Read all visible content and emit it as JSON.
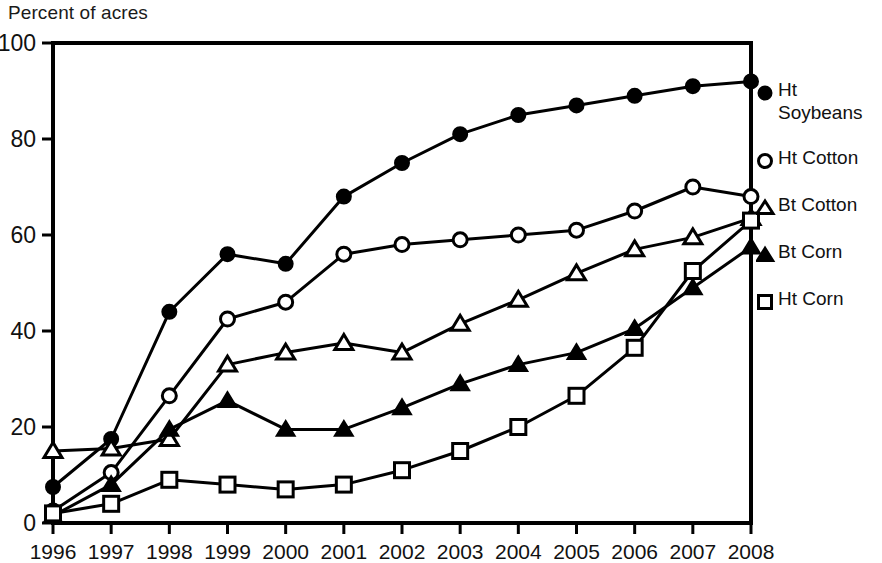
{
  "chart_data": {
    "type": "line",
    "title": "",
    "ylabel": "Percent of acres",
    "xlabel": "",
    "ylim": [
      0,
      100
    ],
    "yticks": [
      0,
      20,
      40,
      60,
      80,
      100
    ],
    "grid": false,
    "legend_position": "right",
    "categories": [
      "1996",
      "1997",
      "1998",
      "1999",
      "2000",
      "2001",
      "2002",
      "2003",
      "2004",
      "2005",
      "2006",
      "2007",
      "2008"
    ],
    "series": [
      {
        "name": "Ht Soybeans",
        "marker": "filled-circle",
        "values": [
          7.5,
          17.5,
          44,
          56,
          54,
          68,
          75,
          81,
          85,
          87,
          89,
          91,
          92
        ]
      },
      {
        "name": "Ht Cotton",
        "marker": "open-circle",
        "values": [
          2.5,
          10.5,
          26.5,
          42.5,
          46,
          56,
          58,
          59,
          60,
          61,
          65,
          70,
          68
        ]
      },
      {
        "name": "Bt Cotton",
        "marker": "open-triangle",
        "values": [
          15,
          15.5,
          17.5,
          33,
          35.5,
          37.5,
          35.5,
          41.5,
          46.5,
          52,
          57,
          59.5,
          63.5
        ]
      },
      {
        "name": "Bt Corn",
        "marker": "filled-triangle",
        "values": [
          1.5,
          8,
          19.5,
          25.5,
          19.5,
          19.5,
          24,
          29,
          33,
          35.5,
          40.5,
          49,
          57.5
        ]
      },
      {
        "name": "Ht Corn",
        "marker": "open-square",
        "values": [
          2,
          4,
          9,
          8,
          7,
          8,
          11,
          15,
          20,
          26.5,
          36.5,
          52.5,
          63
        ]
      }
    ]
  },
  "legend": {
    "entries": [
      {
        "label": "Ht\nSoybeans",
        "marker": "filled-circle"
      },
      {
        "label": "Ht Cotton",
        "marker": "open-circle"
      },
      {
        "label": "Bt Cotton",
        "marker": "open-triangle"
      },
      {
        "label": "Bt Corn",
        "marker": "filled-triangle"
      },
      {
        "label": "Ht Corn",
        "marker": "open-square"
      }
    ]
  },
  "style": {
    "line_color": "#000000",
    "axis_color": "#000000",
    "background": "#ffffff"
  }
}
